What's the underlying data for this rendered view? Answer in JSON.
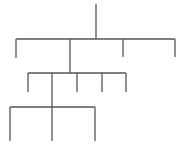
{
  "diagram": {
    "type": "tree",
    "stroke_color": "#555555",
    "stroke_width": 1.3,
    "root": {
      "x": 96,
      "y_top": 4,
      "y_bottom": 39
    },
    "levels": [
      {
        "bar_y": 39,
        "bar_x1": 16,
        "bar_x2": 175,
        "children": [
          {
            "x": 16,
            "y_bottom": 58
          },
          {
            "x": 70,
            "y_bottom": 73,
            "has_subtree": true
          },
          {
            "x": 123,
            "y_bottom": 57
          },
          {
            "x": 175,
            "y_bottom": 57
          }
        ]
      },
      {
        "bar_y": 73,
        "bar_x1": 28,
        "bar_x2": 126,
        "children": [
          {
            "x": 28,
            "y_bottom": 92
          },
          {
            "x": 52,
            "y_bottom": 107,
            "has_subtree": true
          },
          {
            "x": 77,
            "y_bottom": 92
          },
          {
            "x": 102,
            "y_bottom": 92
          },
          {
            "x": 126,
            "y_bottom": 92
          }
        ]
      },
      {
        "bar_y": 107,
        "bar_x1": 10,
        "bar_x2": 95,
        "children": [
          {
            "x": 10,
            "y_bottom": 141
          },
          {
            "x": 52,
            "y_bottom": 141
          },
          {
            "x": 95,
            "y_bottom": 141
          }
        ]
      }
    ]
  }
}
